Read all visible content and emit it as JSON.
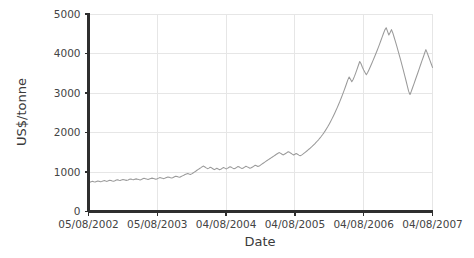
{
  "chart_data": {
    "type": "line",
    "title": "",
    "xlabel": "Date",
    "ylabel": "US$/tonne",
    "grid": true,
    "legend": false,
    "legend_position": "none",
    "line_color": "#9a9a9a",
    "axis_color": "#2e2e2e",
    "grid_color": "#e6e6e6",
    "background_color": "#ffffff",
    "ylim": [
      0,
      5000
    ],
    "yticks": [
      0,
      1000,
      2000,
      3000,
      4000,
      5000
    ],
    "ytick_labels": [
      "0",
      "1000",
      "2000",
      "3000",
      "4000",
      "5000"
    ],
    "xtick_labels": [
      "05/08/2002",
      "05/08/2003",
      "04/08/2004",
      "04/08/2005",
      "04/08/2006",
      "04/08/2007"
    ],
    "xlim_labels": [
      "05/08/2002",
      "04/08/2007"
    ],
    "x_index_range": [
      0,
      260
    ],
    "series": [
      {
        "name": "US$/tonne",
        "color": "#9a9a9a",
        "values": [
          748,
          742,
          756,
          763,
          752,
          745,
          758,
          770,
          765,
          752,
          760,
          775,
          782,
          770,
          762,
          778,
          790,
          785,
          772,
          768,
          780,
          795,
          805,
          792,
          784,
          800,
          812,
          806,
          794,
          788,
          800,
          815,
          822,
          810,
          802,
          818,
          826,
          818,
          808,
          800,
          812,
          828,
          840,
          832,
          820,
          812,
          825,
          838,
          845,
          836,
          826,
          818,
          830,
          845,
          858,
          850,
          840,
          832,
          846,
          862,
          875,
          868,
          856,
          848,
          862,
          880,
          895,
          888,
          876,
          868,
          885,
          902,
          918,
          935,
          950,
          962,
          948,
          936,
          952,
          975,
          998,
          1020,
          1045,
          1068,
          1090,
          1112,
          1135,
          1150,
          1128,
          1105,
          1085,
          1098,
          1120,
          1105,
          1082,
          1060,
          1075,
          1095,
          1078,
          1058,
          1070,
          1092,
          1115,
          1098,
          1078,
          1092,
          1115,
          1135,
          1118,
          1098,
          1082,
          1095,
          1118,
          1140,
          1125,
          1105,
          1088,
          1100,
          1122,
          1145,
          1130,
          1112,
          1095,
          1108,
          1128,
          1150,
          1172,
          1158,
          1138,
          1150,
          1175,
          1198,
          1222,
          1245,
          1268,
          1290,
          1312,
          1335,
          1358,
          1380,
          1402,
          1425,
          1448,
          1470,
          1492,
          1478,
          1455,
          1432,
          1448,
          1470,
          1492,
          1512,
          1498,
          1475,
          1452,
          1430,
          1448,
          1468,
          1450,
          1428,
          1410,
          1428,
          1452,
          1478,
          1505,
          1532,
          1560,
          1588,
          1618,
          1648,
          1680,
          1712,
          1748,
          1785,
          1822,
          1862,
          1905,
          1950,
          1998,
          2048,
          2102,
          2158,
          2218,
          2280,
          2345,
          2412,
          2482,
          2555,
          2630,
          2708,
          2788,
          2872,
          2958,
          3048,
          3140,
          3235,
          3332,
          3405,
          3348,
          3285,
          3340,
          3420,
          3510,
          3605,
          3702,
          3798,
          3740,
          3652,
          3580,
          3520,
          3462,
          3518,
          3590,
          3665,
          3742,
          3820,
          3900,
          3982,
          4065,
          4150,
          4238,
          4328,
          4420,
          4512,
          4598,
          4652,
          4560,
          4468,
          4532,
          4605,
          4520,
          4412,
          4300,
          4185,
          4068,
          3948,
          3825,
          3700,
          3572,
          3442,
          3310,
          3175,
          3040,
          2960,
          3045,
          3138,
          3232,
          3328,
          3425,
          3520,
          3618,
          3715,
          3812,
          3905,
          4005,
          4098,
          4015,
          3925,
          3832,
          3740,
          3648
        ]
      }
    ],
    "annotations": []
  },
  "axes": {
    "y_title": "US$/tonne",
    "x_title": "Date"
  }
}
